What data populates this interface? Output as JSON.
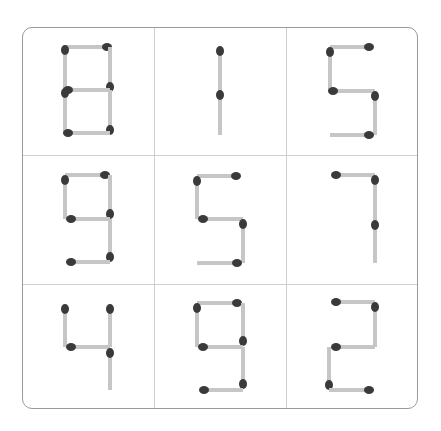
{
  "puzzle": {
    "board": {
      "x": 22,
      "y": 27,
      "width": 396,
      "height": 382,
      "border_color": "#9a9a9a",
      "grid_color": "#cfcfcf"
    },
    "colors": {
      "stick": "#c6c6c6",
      "head": "#3a3a3a"
    },
    "columns_x": [
      22,
      154,
      286,
      418
    ],
    "rows_y": [
      27,
      155,
      284,
      409
    ],
    "cells": [
      {
        "row": 0,
        "col": 0,
        "digit": "8",
        "matches": [
          {
            "x1": 65,
            "y1": 47,
            "x2": 110,
            "y2": 47,
            "head": "end"
          },
          {
            "x1": 65,
            "y1": 47,
            "x2": 65,
            "y2": 90,
            "head": "start"
          },
          {
            "x1": 110,
            "y1": 47,
            "x2": 110,
            "y2": 90,
            "head": "end"
          },
          {
            "x1": 65,
            "y1": 90,
            "x2": 110,
            "y2": 90,
            "head": "start"
          },
          {
            "x1": 65,
            "y1": 90,
            "x2": 65,
            "y2": 133,
            "head": "start"
          },
          {
            "x1": 110,
            "y1": 90,
            "x2": 110,
            "y2": 133,
            "head": "end"
          },
          {
            "x1": 65,
            "y1": 133,
            "x2": 110,
            "y2": 133,
            "head": "start"
          }
        ]
      },
      {
        "row": 0,
        "col": 1,
        "digit": "1",
        "matches": [
          {
            "x1": 220,
            "y1": 48,
            "x2": 220,
            "y2": 92,
            "head": "start"
          },
          {
            "x1": 220,
            "y1": 92,
            "x2": 220,
            "y2": 135,
            "head": "start"
          }
        ]
      },
      {
        "row": 0,
        "col": 2,
        "digit": "5",
        "matches": [
          {
            "x1": 330,
            "y1": 47,
            "x2": 372,
            "y2": 47,
            "head": "end"
          },
          {
            "x1": 330,
            "y1": 49,
            "x2": 330,
            "y2": 91,
            "head": "start"
          },
          {
            "x1": 330,
            "y1": 91,
            "x2": 375,
            "y2": 91,
            "head": "start"
          },
          {
            "x1": 375,
            "y1": 93,
            "x2": 375,
            "y2": 135,
            "head": "start"
          },
          {
            "x1": 330,
            "y1": 135,
            "x2": 372,
            "y2": 135,
            "head": "end"
          }
        ]
      },
      {
        "row": 1,
        "col": 0,
        "digit": "9",
        "matches": [
          {
            "x1": 65,
            "y1": 175,
            "x2": 108,
            "y2": 175,
            "head": "end"
          },
          {
            "x1": 65,
            "y1": 177,
            "x2": 65,
            "y2": 219,
            "head": "start"
          },
          {
            "x1": 110,
            "y1": 175,
            "x2": 110,
            "y2": 217,
            "head": "end"
          },
          {
            "x1": 68,
            "y1": 219,
            "x2": 110,
            "y2": 219,
            "head": "start"
          },
          {
            "x1": 110,
            "y1": 219,
            "x2": 110,
            "y2": 260,
            "head": "end"
          },
          {
            "x1": 68,
            "y1": 262,
            "x2": 110,
            "y2": 262,
            "head": "start"
          }
        ]
      },
      {
        "row": 1,
        "col": 1,
        "digit": "5",
        "matches": [
          {
            "x1": 197,
            "y1": 176,
            "x2": 239,
            "y2": 176,
            "head": "end"
          },
          {
            "x1": 197,
            "y1": 178,
            "x2": 197,
            "y2": 219,
            "head": "start"
          },
          {
            "x1": 200,
            "y1": 219,
            "x2": 243,
            "y2": 219,
            "head": "start"
          },
          {
            "x1": 243,
            "y1": 221,
            "x2": 243,
            "y2": 263,
            "head": "start"
          },
          {
            "x1": 197,
            "y1": 263,
            "x2": 240,
            "y2": 263,
            "head": "end"
          }
        ]
      },
      {
        "row": 1,
        "col": 2,
        "digit": "7",
        "matches": [
          {
            "x1": 333,
            "y1": 175,
            "x2": 375,
            "y2": 175,
            "head": "start"
          },
          {
            "x1": 375,
            "y1": 177,
            "x2": 375,
            "y2": 220,
            "head": "start"
          },
          {
            "x1": 375,
            "y1": 222,
            "x2": 375,
            "y2": 263,
            "head": "start"
          }
        ]
      },
      {
        "row": 2,
        "col": 0,
        "digit": "4",
        "matches": [
          {
            "x1": 65,
            "y1": 306,
            "x2": 65,
            "y2": 347,
            "head": "start"
          },
          {
            "x1": 110,
            "y1": 306,
            "x2": 110,
            "y2": 347,
            "head": "start"
          },
          {
            "x1": 68,
            "y1": 347,
            "x2": 110,
            "y2": 347,
            "head": "start"
          },
          {
            "x1": 110,
            "y1": 350,
            "x2": 110,
            "y2": 390,
            "head": "start"
          }
        ]
      },
      {
        "row": 2,
        "col": 1,
        "digit": "9",
        "matches": [
          {
            "x1": 197,
            "y1": 303,
            "x2": 240,
            "y2": 303,
            "head": "end"
          },
          {
            "x1": 197,
            "y1": 305,
            "x2": 197,
            "y2": 347,
            "head": "start"
          },
          {
            "x1": 243,
            "y1": 303,
            "x2": 243,
            "y2": 344,
            "head": "end"
          },
          {
            "x1": 200,
            "y1": 347,
            "x2": 243,
            "y2": 347,
            "head": "start"
          },
          {
            "x1": 243,
            "y1": 347,
            "x2": 243,
            "y2": 387,
            "head": "end"
          },
          {
            "x1": 201,
            "y1": 390,
            "x2": 243,
            "y2": 390,
            "head": "start"
          }
        ]
      },
      {
        "row": 2,
        "col": 2,
        "digit": "2",
        "matches": [
          {
            "x1": 333,
            "y1": 302,
            "x2": 375,
            "y2": 302,
            "head": "start"
          },
          {
            "x1": 375,
            "y1": 304,
            "x2": 375,
            "y2": 347,
            "head": "start"
          },
          {
            "x1": 333,
            "y1": 347,
            "x2": 375,
            "y2": 347,
            "head": "start"
          },
          {
            "x1": 329,
            "y1": 347,
            "x2": 329,
            "y2": 388,
            "head": "end"
          },
          {
            "x1": 329,
            "y1": 390,
            "x2": 372,
            "y2": 390,
            "head": "end"
          }
        ]
      }
    ]
  }
}
